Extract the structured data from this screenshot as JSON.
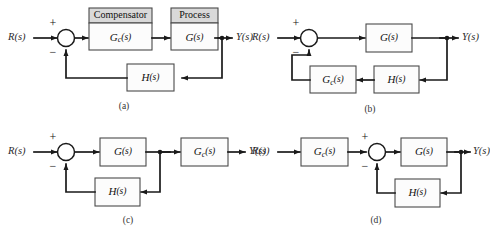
{
  "figure": {
    "type": "control-system-block-diagrams",
    "background_color": "#ffffff",
    "line_color": "#1a1a1a",
    "block_fill": "#fcfcfc",
    "block_header_fill": "#d9d9d9",
    "block_border": "#4a4a4a",
    "panel_count": 4
  },
  "signals": {
    "input": "R(s)",
    "output": "Y(s)",
    "plus": "+",
    "minus": "−"
  },
  "blocks": {
    "compensator_header": "Compensator",
    "process_header": "Process",
    "gc": {
      "base": "G",
      "sub": "c",
      "arg": "(s)"
    },
    "g": {
      "base": "G",
      "sub": "",
      "arg": "(s)"
    },
    "h": {
      "base": "H",
      "sub": "",
      "arg": "(s)"
    }
  },
  "panels": [
    {
      "id": "a",
      "caption": "(a)",
      "description": "Cascade compensation: compensator Gc(s) followed by process G(s) in the forward path, unity-gain summing junction, H(s) in the feedback path.",
      "input_label": "R(s)",
      "output_label": "Y(s)",
      "summing_signs": {
        "top": "+",
        "bottom": "−"
      },
      "forward_blocks": [
        "Compensator Gc(s)",
        "Process G(s)"
      ],
      "feedback_blocks": [
        "H(s)"
      ],
      "has_headers": true
    },
    {
      "id": "b",
      "caption": "(b)",
      "description": "Feedback compensation: G(s) in the forward path, with H(s) and Gc(s) in series in the feedback path.",
      "input_label": "R(s)",
      "output_label": "Y(s)",
      "summing_signs": {
        "top": "+",
        "bottom": "−"
      },
      "forward_blocks": [
        "G(s)"
      ],
      "feedback_blocks": [
        "H(s)",
        "Gc(s)"
      ],
      "has_headers": false
    },
    {
      "id": "c",
      "caption": "(c)",
      "description": "Output compensation: inner loop of G(s) with H(s) feedback, followed by Gc(s) after the takeoff point.",
      "input_label": "R(s)",
      "output_label": "Y(s)",
      "summing_signs": {
        "top": "+",
        "bottom": "−"
      },
      "forward_blocks": [
        "G(s)",
        "Gc(s)"
      ],
      "feedback_blocks": [
        "H(s)"
      ],
      "has_headers": false
    },
    {
      "id": "d",
      "caption": "(d)",
      "description": "Input compensation: Gc(s) placed ahead of the summing junction, G(s) in the forward path, H(s) in the feedback path.",
      "input_label": "R(s)",
      "output_label": "Y(s)",
      "summing_signs": {
        "top": "+",
        "bottom": "−"
      },
      "forward_blocks": [
        "Gc(s)",
        "G(s)"
      ],
      "feedback_blocks": [
        "H(s)"
      ],
      "has_headers": false
    }
  ]
}
